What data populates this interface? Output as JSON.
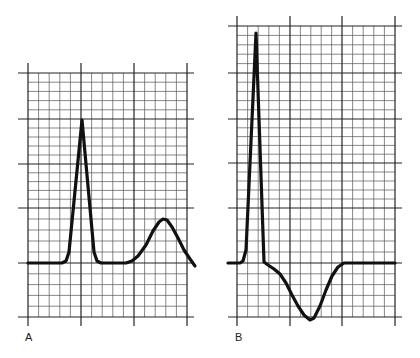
{
  "figure": {
    "panels": [
      {
        "label": "A",
        "grid": {
          "major_x": [
            28,
            81,
            134,
            187
          ],
          "major_y": [
            73,
            119,
            164,
            208,
            263,
            317
          ],
          "minor_per_major": 5,
          "x_extent": [
            18,
            194
          ],
          "y_extent": [
            63,
            326
          ]
        },
        "trace": {
          "description": "QRS spike followed by upright T wave",
          "points": [
            [
              28,
              263
            ],
            [
              62,
              263
            ],
            [
              66,
              261
            ],
            [
              69,
              252
            ],
            [
              82,
              120
            ],
            [
              94,
              252
            ],
            [
              97,
              261
            ],
            [
              101,
              263
            ],
            [
              126,
              263
            ],
            [
              132,
              261
            ],
            [
              138,
              256
            ],
            [
              146,
              245
            ],
            [
              153,
              231
            ],
            [
              159,
              222
            ],
            [
              163,
              219
            ],
            [
              167,
              220
            ],
            [
              172,
              227
            ],
            [
              178,
              238
            ],
            [
              184,
              250
            ],
            [
              190,
              259
            ],
            [
              195,
              266
            ]
          ]
        }
      },
      {
        "label": "B",
        "grid": {
          "major_x": [
            237,
            290,
            342,
            395
          ],
          "major_y": [
            26,
            73,
            119,
            163,
            208,
            263,
            317
          ],
          "minor_per_major": 5,
          "x_extent": [
            228,
            402
          ],
          "y_extent": [
            16,
            326
          ]
        },
        "trace": {
          "description": "Tall QRS spike followed by inverted T wave",
          "points": [
            [
              228,
              263
            ],
            [
              240,
              263
            ],
            [
              243,
              261
            ],
            [
              246,
              250
            ],
            [
              256,
              33
            ],
            [
              264,
              262
            ],
            [
              268,
              265
            ],
            [
              274,
              269
            ],
            [
              280,
              274
            ],
            [
              286,
              283
            ],
            [
              292,
              295
            ],
            [
              298,
              306
            ],
            [
              304,
              315
            ],
            [
              310,
              320
            ],
            [
              314,
              318
            ],
            [
              320,
              306
            ],
            [
              326,
              290
            ],
            [
              332,
              276
            ],
            [
              338,
              267
            ],
            [
              344,
              263
            ],
            [
              395,
              263
            ]
          ]
        }
      }
    ],
    "style": {
      "line_color": "#111111",
      "grid_major_color": "#222222",
      "grid_minor_color": "#555555",
      "background": "#ffffff"
    }
  }
}
